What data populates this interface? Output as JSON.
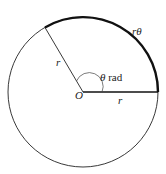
{
  "diagram": {
    "center_label": "O",
    "radius_label_1": "r",
    "radius_label_2": "r",
    "angle_symbol": "θ",
    "angle_unit": " rad",
    "arc_label_r": "r",
    "arc_label_theta": "θ"
  }
}
